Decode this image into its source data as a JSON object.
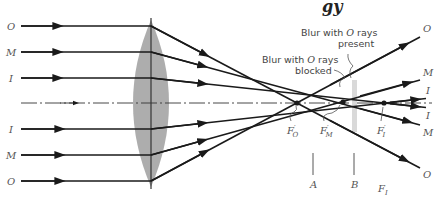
{
  "diagram": {
    "title_fragment": "gy",
    "type": "ray-diagram",
    "colors": {
      "ray": "#1a1a1a",
      "lens": "#a9a9a9",
      "axis": "#333333",
      "label": "#555555",
      "blur_band": "#d9d9d9"
    },
    "left_labels": [
      "O",
      "M",
      "I",
      "I",
      "M",
      "O"
    ],
    "right_labels": [
      "O",
      "M",
      "I",
      "I",
      "M",
      "O"
    ],
    "focal_points": [
      {
        "label": "F",
        "sub": "O",
        "prime": "′"
      },
      {
        "label": "F",
        "sub": "M",
        "prime": "′"
      },
      {
        "label": "F",
        "sub": "I",
        "prime": "′"
      }
    ],
    "annotations": {
      "blocked_line1": "Blur with ",
      "blocked_italic": "O",
      "blocked_line1_end": " rays",
      "blocked_line2": "blocked",
      "present_line1": "Blur with ",
      "present_italic": "O",
      "present_line1_end": " rays",
      "present_line2": "present"
    },
    "planes": [
      {
        "label": "A"
      },
      {
        "label": "B"
      }
    ],
    "paraxial_focus_label": {
      "label": "F",
      "sub": "I"
    }
  }
}
